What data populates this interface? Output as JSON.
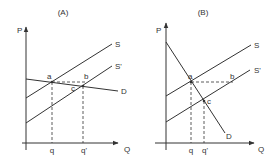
{
  "panels": [
    {
      "id": "A",
      "title": "(A)",
      "y_axis_label": "P",
      "x_axis_label": "Q",
      "curves": [
        {
          "name": "S",
          "label": "S"
        },
        {
          "name": "S_prime",
          "label": "S'"
        },
        {
          "name": "D",
          "label": "D",
          "slope_description": "relatively flat (elastic) demand"
        }
      ],
      "points": [
        {
          "name": "a",
          "label": "a"
        },
        {
          "name": "b",
          "label": "b"
        },
        {
          "name": "c",
          "label": "c"
        }
      ],
      "quantity_ticks": [
        {
          "name": "q",
          "label": "q"
        },
        {
          "name": "q_prime",
          "label": "q'"
        }
      ]
    },
    {
      "id": "B",
      "title": "(B)",
      "y_axis_label": "P",
      "x_axis_label": "Q",
      "curves": [
        {
          "name": "S",
          "label": "S"
        },
        {
          "name": "S_prime",
          "label": "S'"
        },
        {
          "name": "D",
          "label": "D",
          "slope_description": "steep (inelastic) demand"
        }
      ],
      "points": [
        {
          "name": "a",
          "label": "a"
        },
        {
          "name": "b",
          "label": "b"
        },
        {
          "name": "c",
          "label": "c"
        }
      ],
      "quantity_ticks": [
        {
          "name": "q",
          "label": "q"
        },
        {
          "name": "q_prime",
          "label": "q'"
        }
      ]
    }
  ],
  "colors": {
    "line": "#333333",
    "background": "#ffffff"
  }
}
